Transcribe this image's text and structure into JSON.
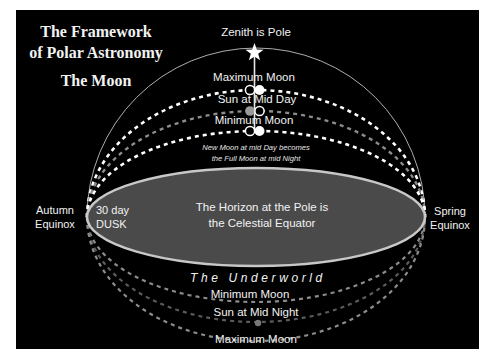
{
  "title": {
    "line1": "The Framework",
    "line2": "of Polar Astronomy",
    "subtitle": "The Moon"
  },
  "labels": {
    "zenith": "Zenith is Pole",
    "maximum_moon_upper": "Maximum Moon",
    "sun_mid_day": "Sun at Mid Day",
    "minimum_moon_upper": "Minimum Moon",
    "note_line1": "New Moon at mid Day becomes",
    "note_line2": "the Full Moon at mid Night",
    "autumn_line1": "Autumn",
    "autumn_line2": "Equinox",
    "dusk_line1": "30 day",
    "dusk_line2": "DUSK",
    "horizon_line1": "The Horizon at the Pole is",
    "horizon_line2": "the Celestial Equator",
    "spring_line1": "Spring",
    "spring_line2": "Equinox",
    "underworld": "The Underworld",
    "minimum_moon_lower": "Minimum Moon",
    "sun_mid_night": "Sun at Mid Night",
    "maximum_moon_lower": "Maximum Moon"
  },
  "colors": {
    "background": "#000000",
    "text": "#f2f2f2",
    "horizon_fill": "#4a4a4a",
    "horizon_stroke": "#c8c8c8",
    "dash_white": "#ffffff",
    "dash_gray": "#8c8c8c"
  }
}
